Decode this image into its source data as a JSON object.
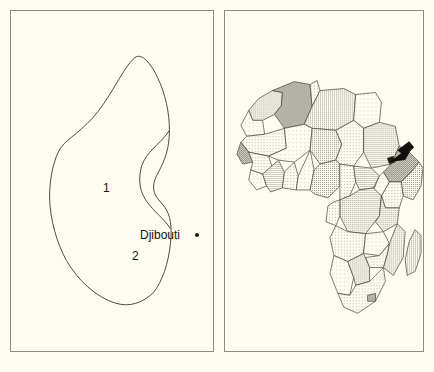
{
  "figure": {
    "type": "locator-map-pair",
    "background_color": "#fdfcf0",
    "border_color": "#8e8c80"
  },
  "left_panel": {
    "name": "djibouti-outline-map",
    "subject": "Djibouti",
    "outline_color": "#4a4a44",
    "fill_color": "#fdfcf0",
    "region_labels": [
      {
        "id": "1",
        "label": "1",
        "x": 96,
        "y": 177
      },
      {
        "id": "2",
        "label": "2",
        "x": 125,
        "y": 245
      }
    ],
    "city_markers": [
      {
        "name": "Djibouti",
        "label": "Djibouti",
        "marker": "filled-dot",
        "x": 186,
        "y": 224
      }
    ]
  },
  "right_panel": {
    "name": "africa-locator-map",
    "subject": "Africa",
    "border_color": "#45443c",
    "arrow": {
      "name": "location-arrow",
      "label": "arrow pointing to Djibouti",
      "direction": "down-left",
      "color": "#100f0a",
      "tip_x": 389,
      "tip_y": 159
    },
    "shading_note": "countries filled with halftone dither patterns of varying density"
  }
}
